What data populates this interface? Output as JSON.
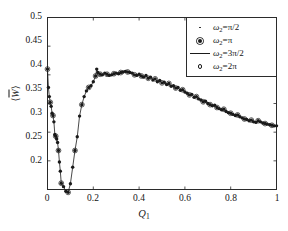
{
  "chart_data": {
    "type": "line",
    "title": "",
    "xlabel": "Q_1",
    "ylabel": "<W>",
    "xlabel_display": "Q",
    "xlabel_sub": "1",
    "ylabel_display": "W",
    "xlim": [
      0,
      1
    ],
    "ylim": [
      0.2,
      0.5
    ],
    "grid": false,
    "legend_position": "upper right",
    "xticks": [
      "0",
      "0.2",
      "0.4",
      "0.6",
      "0.8",
      "1"
    ],
    "xtick_values": [
      0,
      0.2,
      0.4,
      0.6,
      0.8,
      1
    ],
    "yticks": [
      "0.2",
      "0.25",
      "0.3",
      "0.35",
      "0.4",
      "0.45",
      "0.5"
    ],
    "ytick_values": [
      0.2,
      0.25,
      0.3,
      0.35,
      0.4,
      0.45,
      0.5
    ],
    "series": [
      {
        "name": "omega_2 = pi/2",
        "label_base": "ω",
        "label_sub": "2",
        "label_eq": "=π/2",
        "marker": "point",
        "color": "#1a1a1a",
        "x": [
          0.0,
          0.005,
          0.01,
          0.015,
          0.02,
          0.025,
          0.03,
          0.035,
          0.04,
          0.045,
          0.05,
          0.055,
          0.06,
          0.07,
          0.08,
          0.09,
          0.1,
          0.11,
          0.12,
          0.13,
          0.14,
          0.15,
          0.16,
          0.17,
          0.18,
          0.19,
          0.2,
          0.21,
          0.22,
          0.23,
          0.24,
          0.25,
          0.26,
          0.27,
          0.28,
          0.29,
          0.3,
          0.31,
          0.32,
          0.33,
          0.34,
          0.35,
          0.36,
          0.37,
          0.38,
          0.39,
          0.4,
          0.41,
          0.42,
          0.43,
          0.44,
          0.45,
          0.46,
          0.47,
          0.48,
          0.49,
          0.5,
          0.51,
          0.52,
          0.53,
          0.54,
          0.55,
          0.56,
          0.57,
          0.58,
          0.59,
          0.6,
          0.61,
          0.62,
          0.63,
          0.64,
          0.65,
          0.66,
          0.67,
          0.68,
          0.69,
          0.7,
          0.71,
          0.72,
          0.73,
          0.74,
          0.75,
          0.76,
          0.77,
          0.78,
          0.79,
          0.8,
          0.81,
          0.82,
          0.83,
          0.84,
          0.85,
          0.86,
          0.87,
          0.88,
          0.89,
          0.9,
          0.91,
          0.92,
          0.93,
          0.94,
          0.95,
          0.96,
          0.97,
          0.98,
          0.99,
          1.0
        ],
        "y": [
          0.41,
          0.392,
          0.375,
          0.362,
          0.352,
          0.343,
          0.333,
          0.322,
          0.312,
          0.3,
          0.296,
          0.29,
          0.284,
          0.272,
          0.262,
          0.252,
          0.243,
          0.232,
          0.222,
          0.214,
          0.209,
          0.204,
          0.199,
          0.196,
          0.194,
          0.196,
          0.199,
          0.205,
          0.212,
          0.22,
          0.229,
          0.238,
          0.246,
          0.255,
          0.264,
          0.272,
          0.28,
          0.288,
          0.295,
          0.302,
          0.309,
          0.316,
          0.322,
          0.328,
          0.334,
          0.34,
          0.346,
          0.352,
          0.358,
          0.363,
          0.368,
          0.373,
          0.378,
          0.382,
          0.386,
          0.39,
          0.393,
          0.396,
          0.399,
          0.401,
          0.403,
          0.405,
          0.407,
          0.408,
          0.409,
          0.41,
          0.41,
          0.409,
          0.407,
          0.405,
          0.404,
          0.403,
          0.403,
          0.403,
          0.403,
          0.403,
          0.404,
          0.404,
          0.405,
          0.405,
          0.405,
          0.406,
          0.406,
          0.406,
          0.406,
          0.405,
          0.405,
          0.404,
          0.403,
          0.402,
          0.401,
          0.4,
          0.398,
          0.396,
          0.394,
          0.392,
          0.39,
          0.387,
          0.385,
          0.382,
          0.379,
          0.376,
          0.373,
          0.37,
          0.367,
          0.364,
          0.361
        ]
      },
      {
        "name": "omega_2 = pi",
        "label_base": "ω",
        "label_sub": "2",
        "label_eq": "=π",
        "marker": "star",
        "color": "#1a1a1a"
      },
      {
        "name": "omega_2 = 3pi/2",
        "label_base": "ω",
        "label_sub": "2",
        "label_eq": "=3π/2",
        "marker": "line",
        "color": "#1a1a1a"
      },
      {
        "name": "omega_2 = 2pi",
        "label_base": "ω",
        "label_sub": "2",
        "label_eq": "=2π",
        "marker": "circle",
        "color": "#1a1a1a"
      }
    ],
    "curve_points": {
      "x": [
        0.0,
        0.004,
        0.008,
        0.012,
        0.016,
        0.02,
        0.024,
        0.028,
        0.032,
        0.036,
        0.04,
        0.044,
        0.048,
        0.052,
        0.056,
        0.06,
        0.07,
        0.08,
        0.09,
        0.1,
        0.11,
        0.12,
        0.13,
        0.14,
        0.15,
        0.16,
        0.17,
        0.18,
        0.19,
        0.2,
        0.21,
        0.215,
        0.22,
        0.23,
        0.24,
        0.25,
        0.26,
        0.27,
        0.28,
        0.29,
        0.3,
        0.31,
        0.32,
        0.33,
        0.34,
        0.35,
        0.36,
        0.37,
        0.38,
        0.39,
        0.4,
        0.41,
        0.42,
        0.43,
        0.44,
        0.45,
        0.46,
        0.47,
        0.48,
        0.49,
        0.5,
        0.51,
        0.52,
        0.53,
        0.54,
        0.55,
        0.56,
        0.57,
        0.58,
        0.59,
        0.6,
        0.61,
        0.62,
        0.63,
        0.64,
        0.65,
        0.66,
        0.67,
        0.68,
        0.69,
        0.7,
        0.71,
        0.72,
        0.73,
        0.74,
        0.75,
        0.76,
        0.77,
        0.78,
        0.79,
        0.8,
        0.81,
        0.82,
        0.83,
        0.84,
        0.85,
        0.86,
        0.87,
        0.88,
        0.89,
        0.9,
        0.91,
        0.92,
        0.93,
        0.94,
        0.95,
        0.96,
        0.97,
        0.98,
        0.99,
        1.0
      ],
      "y": [
        0.41,
        0.378,
        0.362,
        0.352,
        0.345,
        0.333,
        0.329,
        0.318,
        0.296,
        0.293,
        0.288,
        0.282,
        0.268,
        0.248,
        0.232,
        0.211,
        0.205,
        0.197,
        0.195,
        0.21,
        0.239,
        0.268,
        0.292,
        0.328,
        0.348,
        0.362,
        0.372,
        0.378,
        0.381,
        0.388,
        0.398,
        0.41,
        0.404,
        0.401,
        0.4,
        0.403,
        0.401,
        0.399,
        0.4,
        0.402,
        0.403,
        0.402,
        0.404,
        0.405,
        0.406,
        0.405,
        0.404,
        0.403,
        0.4,
        0.399,
        0.401,
        0.398,
        0.396,
        0.399,
        0.394,
        0.396,
        0.391,
        0.393,
        0.388,
        0.39,
        0.386,
        0.387,
        0.383,
        0.385,
        0.38,
        0.381,
        0.377,
        0.378,
        0.373,
        0.374,
        0.37,
        0.368,
        0.365,
        0.366,
        0.361,
        0.362,
        0.358,
        0.356,
        0.353,
        0.354,
        0.35,
        0.348,
        0.346,
        0.347,
        0.343,
        0.341,
        0.339,
        0.34,
        0.336,
        0.334,
        0.333,
        0.331,
        0.329,
        0.33,
        0.327,
        0.325,
        0.323,
        0.322,
        0.32,
        0.321,
        0.318,
        0.317,
        0.32,
        0.318,
        0.316,
        0.315,
        0.314,
        0.313,
        0.312,
        0.311,
        0.311
      ]
    }
  },
  "legend": {
    "entries": [
      {
        "symbol": "point-marker",
        "base": "ω",
        "sub": "2",
        "rest": "=π/2"
      },
      {
        "symbol": "star-marker",
        "base": "ω",
        "sub": "2",
        "rest": "=π"
      },
      {
        "symbol": "solid-line",
        "base": "ω",
        "sub": "2",
        "rest": "=3π/2"
      },
      {
        "symbol": "open-circle-marker",
        "base": "ω",
        "sub": "2",
        "rest": "=2π"
      }
    ]
  },
  "axes": {
    "y_tick_labels": [
      "0.5",
      "0.45",
      "0.4",
      "0.35",
      "0.3",
      "0.25",
      "0.2"
    ],
    "x_tick_labels": [
      "0",
      "0.2",
      "0.4",
      "0.6",
      "0.8",
      "1"
    ],
    "x_axis_title_base": "Q",
    "x_axis_title_sub": "1",
    "y_axis_title_base": "W"
  },
  "colors": {
    "axis": "#2b2b2b",
    "data": "#1a1a1a",
    "background": "#ffffff"
  }
}
